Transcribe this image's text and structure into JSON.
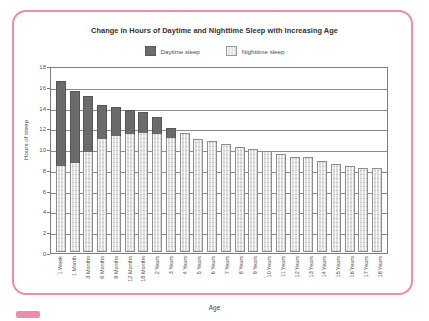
{
  "frame": {
    "border_color": "#ef8ca8"
  },
  "chart_data": {
    "type": "bar",
    "subtype": "stacked",
    "title": "Change in Hours of Daytime and Nighttime Sleep with Increasing Age",
    "xlabel": "Age",
    "ylabel": "Hours of sleep",
    "ylim": [
      0,
      18
    ],
    "yticks": [
      0,
      2,
      4,
      6,
      8,
      10,
      12,
      14,
      16,
      18
    ],
    "grid": true,
    "legend_position": "top-center",
    "colors": {
      "daytime": "#6b6b6b",
      "nighttime": "#e0e0e0"
    },
    "categories": [
      "1 Week",
      "1 Month",
      "3 Months",
      "6 Months",
      "9 Months",
      "12 Months",
      "18 Months",
      "2 Years",
      "3 Years",
      "4 Years",
      "5 Years",
      "6 Years",
      "7 Years",
      "8 Years",
      "9 Years",
      "10 Years",
      "11 Years",
      "12 Years",
      "13 Years",
      "14 Years",
      "15 Years",
      "16 Years",
      "17 Years",
      "18 Years"
    ],
    "series": [
      {
        "name": "Nighttime sleep",
        "values": [
          8.3,
          8.6,
          9.6,
          10.9,
          11.2,
          11.4,
          11.5,
          11.4,
          11.0,
          11.5,
          10.9,
          10.7,
          10.4,
          10.1,
          9.9,
          9.7,
          9.4,
          9.1,
          9.1,
          8.8,
          8.5,
          8.3,
          8.1,
          8.1
        ]
      },
      {
        "name": "Daytime sleep",
        "values": [
          8.2,
          6.9,
          5.4,
          3.3,
          2.8,
          2.3,
          2.0,
          1.6,
          0.9,
          0,
          0,
          0,
          0,
          0,
          0,
          0,
          0,
          0,
          0,
          0,
          0,
          0,
          0,
          0
        ]
      }
    ]
  },
  "legend": {
    "items": [
      {
        "label": "Daytime sleep",
        "key": "day"
      },
      {
        "label": "Nighttime sleep",
        "key": "night"
      }
    ]
  }
}
